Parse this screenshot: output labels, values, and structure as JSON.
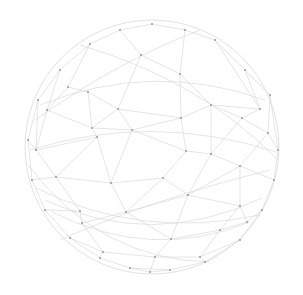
{
  "graphic": {
    "type": "wireframe-network-sphere",
    "background": "#ffffff",
    "line_color": "#d4d4d4",
    "node_color": "#9a9a9a",
    "center": [
      152,
      147
    ],
    "radius": 127,
    "nodes": [
      [
        118,
        109
      ],
      [
        181,
        118
      ],
      [
        211,
        105
      ],
      [
        132,
        130
      ],
      [
        92,
        128
      ],
      [
        186,
        151
      ],
      [
        211,
        154
      ],
      [
        163,
        178
      ],
      [
        111,
        183
      ],
      [
        188,
        195
      ],
      [
        126,
        212
      ],
      [
        240,
        206
      ],
      [
        240,
        166
      ],
      [
        242,
        118
      ],
      [
        180,
        74
      ],
      [
        141,
        55
      ],
      [
        97,
        137
      ],
      [
        56,
        177
      ],
      [
        36,
        150
      ],
      [
        47,
        110
      ],
      [
        68,
        87
      ],
      [
        88,
        92
      ],
      [
        260,
        109
      ],
      [
        268,
        133
      ],
      [
        171,
        239
      ],
      [
        155,
        257
      ],
      [
        80,
        211
      ],
      [
        82,
        223
      ],
      [
        103,
        252
      ],
      [
        220,
        230
      ],
      [
        247,
        222
      ],
      [
        200,
        257
      ],
      [
        152,
        24
      ],
      [
        120,
        30
      ],
      [
        185,
        30
      ],
      [
        90,
        44
      ],
      [
        215,
        40
      ],
      [
        60,
        70
      ],
      [
        245,
        70
      ],
      [
        38,
        100
      ],
      [
        270,
        95
      ],
      [
        28,
        140
      ],
      [
        278,
        150
      ],
      [
        32,
        180
      ],
      [
        274,
        180
      ],
      [
        45,
        210
      ],
      [
        262,
        210
      ],
      [
        70,
        238
      ],
      [
        240,
        240
      ],
      [
        100,
        258
      ],
      [
        205,
        262
      ],
      [
        130,
        268
      ],
      [
        170,
        270
      ],
      [
        150,
        272
      ]
    ],
    "edges": [
      [
        0,
        1
      ],
      [
        1,
        2
      ],
      [
        0,
        3
      ],
      [
        3,
        1
      ],
      [
        0,
        4
      ],
      [
        4,
        3
      ],
      [
        3,
        5
      ],
      [
        1,
        5
      ],
      [
        5,
        6
      ],
      [
        2,
        6
      ],
      [
        2,
        13
      ],
      [
        13,
        6
      ],
      [
        6,
        12
      ],
      [
        12,
        11
      ],
      [
        5,
        7
      ],
      [
        7,
        9
      ],
      [
        9,
        6
      ],
      [
        9,
        11
      ],
      [
        7,
        8
      ],
      [
        8,
        3
      ],
      [
        8,
        10
      ],
      [
        10,
        7
      ],
      [
        10,
        9
      ],
      [
        4,
        16
      ],
      [
        16,
        8
      ],
      [
        16,
        17
      ],
      [
        17,
        8
      ],
      [
        17,
        18
      ],
      [
        18,
        16
      ],
      [
        18,
        19
      ],
      [
        19,
        4
      ],
      [
        19,
        20
      ],
      [
        20,
        21
      ],
      [
        21,
        0
      ],
      [
        21,
        4
      ],
      [
        0,
        15
      ],
      [
        15,
        14
      ],
      [
        14,
        1
      ],
      [
        14,
        2
      ],
      [
        2,
        22
      ],
      [
        22,
        13
      ],
      [
        13,
        23
      ],
      [
        23,
        12
      ],
      [
        12,
        9
      ],
      [
        11,
        29
      ],
      [
        29,
        24
      ],
      [
        24,
        9
      ],
      [
        24,
        10
      ],
      [
        10,
        27
      ],
      [
        27,
        26
      ],
      [
        26,
        17
      ],
      [
        27,
        28
      ],
      [
        28,
        25
      ],
      [
        25,
        24
      ],
      [
        25,
        31
      ],
      [
        31,
        29
      ],
      [
        29,
        30
      ],
      [
        30,
        11
      ],
      [
        15,
        33
      ],
      [
        33,
        32
      ],
      [
        32,
        34
      ],
      [
        34,
        14
      ],
      [
        33,
        35
      ],
      [
        35,
        20
      ],
      [
        34,
        36
      ],
      [
        36,
        22
      ],
      [
        35,
        37
      ],
      [
        37,
        19
      ],
      [
        36,
        38
      ],
      [
        38,
        22
      ],
      [
        37,
        39
      ],
      [
        39,
        18
      ],
      [
        38,
        40
      ],
      [
        40,
        23
      ],
      [
        39,
        41
      ],
      [
        41,
        18
      ],
      [
        40,
        42
      ],
      [
        42,
        23
      ],
      [
        41,
        43
      ],
      [
        43,
        17
      ],
      [
        42,
        44
      ],
      [
        44,
        12
      ],
      [
        43,
        45
      ],
      [
        45,
        26
      ],
      [
        44,
        46
      ],
      [
        46,
        30
      ],
      [
        45,
        47
      ],
      [
        47,
        28
      ],
      [
        46,
        48
      ],
      [
        48,
        31
      ],
      [
        47,
        49
      ],
      [
        49,
        28
      ],
      [
        48,
        50
      ],
      [
        50,
        31
      ],
      [
        49,
        51
      ],
      [
        51,
        52
      ],
      [
        52,
        50
      ],
      [
        51,
        53
      ],
      [
        53,
        52
      ],
      [
        53,
        25
      ]
    ],
    "arcs": [
      "M30,150 Q152,112 276,152",
      "M40,105 Q152,60 265,100",
      "M45,200 Q152,250 262,198",
      "M35,120 Q120,60 200,30",
      "M60,240 Q150,200 270,170",
      "M80,45 Q200,80 278,160",
      "M28,165 Q100,260 210,262",
      "M52,212 Q152,262 250,222",
      "M36,188 Q140,240 260,215"
    ]
  }
}
